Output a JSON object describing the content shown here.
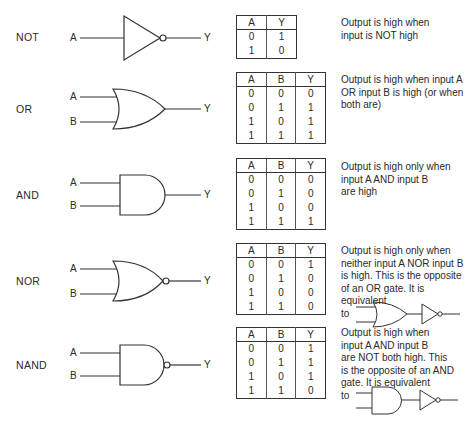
{
  "gates": [
    {
      "name": "NOT",
      "inputs": [
        "A"
      ],
      "output": "Y",
      "table": {
        "headers": [
          "A",
          "Y"
        ],
        "rows": [
          [
            "0",
            "1"
          ],
          [
            "1",
            "0"
          ]
        ]
      },
      "description": [
        "Output is high when",
        "input is NOT high"
      ]
    },
    {
      "name": "OR",
      "inputs": [
        "A",
        "B"
      ],
      "output": "Y",
      "table": {
        "headers": [
          "A",
          "B",
          "Y"
        ],
        "rows": [
          [
            "0",
            "0",
            "0"
          ],
          [
            "0",
            "1",
            "1"
          ],
          [
            "1",
            "0",
            "1"
          ],
          [
            "1",
            "1",
            "1"
          ]
        ]
      },
      "description": [
        "Output is high when input A",
        "OR input B is high (or when",
        "both are)"
      ]
    },
    {
      "name": "AND",
      "inputs": [
        "A",
        "B"
      ],
      "output": "Y",
      "table": {
        "headers": [
          "A",
          "B",
          "Y"
        ],
        "rows": [
          [
            "0",
            "0",
            "0"
          ],
          [
            "0",
            "1",
            "0"
          ],
          [
            "1",
            "0",
            "0"
          ],
          [
            "1",
            "1",
            "1"
          ]
        ]
      },
      "description": [
        "Output is high only when",
        "input A AND input B",
        "are high"
      ]
    },
    {
      "name": "NOR",
      "inputs": [
        "A",
        "B"
      ],
      "output": "Y",
      "table": {
        "headers": [
          "A",
          "B",
          "Y"
        ],
        "rows": [
          [
            "0",
            "0",
            "1"
          ],
          [
            "0",
            "1",
            "0"
          ],
          [
            "1",
            "0",
            "0"
          ],
          [
            "1",
            "1",
            "0"
          ]
        ]
      },
      "description": [
        "Output is high only when",
        "neither input A NOR input B",
        "is high. This is the opposite",
        "of an OR gate. It is equivalent",
        "to"
      ],
      "equivalent_icon": "or-gate-plus-inverter"
    },
    {
      "name": "NAND",
      "inputs": [
        "A",
        "B"
      ],
      "output": "Y",
      "table": {
        "headers": [
          "A",
          "B",
          "Y"
        ],
        "rows": [
          [
            "0",
            "0",
            "1"
          ],
          [
            "0",
            "1",
            "1"
          ],
          [
            "1",
            "0",
            "1"
          ],
          [
            "1",
            "1",
            "0"
          ]
        ]
      },
      "description": [
        "Output is high when",
        "input A AND input B",
        "are NOT both high. This",
        "is the opposite of an AND",
        "gate. It is equivalent",
        "to"
      ],
      "equivalent_icon": "and-gate-plus-inverter"
    }
  ]
}
